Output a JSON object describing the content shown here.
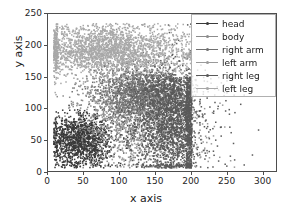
{
  "figure": {
    "xlabel": "x axis",
    "ylabel": "y axis",
    "background": "#ffffff",
    "frame_color": "#4d4d4d"
  },
  "axis": {
    "x_ticks": [
      "0",
      "50",
      "100",
      "150",
      "200",
      "250",
      "300"
    ],
    "y_ticks": [
      "0",
      "50",
      "100",
      "150",
      "200",
      "250"
    ]
  },
  "legend": {
    "entries": [
      {
        "label": "head",
        "color": "#3a3a3a"
      },
      {
        "label": "body",
        "color": "#8c8c8c"
      },
      {
        "label": "right arm",
        "color": "#707070"
      },
      {
        "label": "left arm",
        "color": "#9a9a9a"
      },
      {
        "label": "right leg",
        "color": "#5a5a5a"
      },
      {
        "label": "left leg",
        "color": "#a8a8a8"
      }
    ]
  },
  "chart_data": {
    "type": "scatter",
    "title": "",
    "xlabel": "x axis",
    "ylabel": "y axis",
    "xlim": [
      0,
      320
    ],
    "ylim": [
      250,
      0
    ],
    "y_inverted": true,
    "grid": false,
    "legend_position": "upper right",
    "xticks": [
      0,
      50,
      100,
      150,
      200,
      250,
      300
    ],
    "yticks": [
      0,
      50,
      100,
      150,
      200,
      250
    ],
    "series": [
      {
        "name": "head",
        "color": "#3a3a3a",
        "n_points": 1400,
        "center_x": 45,
        "center_y": 50,
        "spread_x": 22,
        "spread_y": 20,
        "comment": "dense dark cluster upper-left around x=20-80, y=15-95"
      },
      {
        "name": "body",
        "color": "#8c8c8c",
        "n_points": 900,
        "center_x": 95,
        "center_y": 105,
        "spread_x": 30,
        "spread_y": 42,
        "comment": "diffuse mid-gray spread across middle-left"
      },
      {
        "name": "right arm",
        "color": "#707070",
        "n_points": 1500,
        "center_x": 135,
        "center_y": 125,
        "spread_x": 30,
        "spread_y": 22,
        "comment": "mid-gray cluster centered near x=130, y=128"
      },
      {
        "name": "left arm",
        "color": "#9a9a9a",
        "n_points": 700,
        "center_x": 150,
        "center_y": 60,
        "spread_x": 35,
        "spread_y": 30,
        "comment": "upper-middle lighter spread"
      },
      {
        "name": "right leg",
        "color": "#5a5a5a",
        "n_points": 2600,
        "center_x": 178,
        "center_y": 85,
        "spread_x": 30,
        "spread_y": 48,
        "comment": "dark dense band right side, hard right edge near x=200, tail to x=290"
      },
      {
        "name": "left leg",
        "color": "#a8a8a8",
        "n_points": 2400,
        "center_x": 85,
        "center_y": 193,
        "spread_x": 55,
        "spread_y": 20,
        "comment": "light gray broad band bottom, x=10-200, y=165-230"
      }
    ]
  }
}
